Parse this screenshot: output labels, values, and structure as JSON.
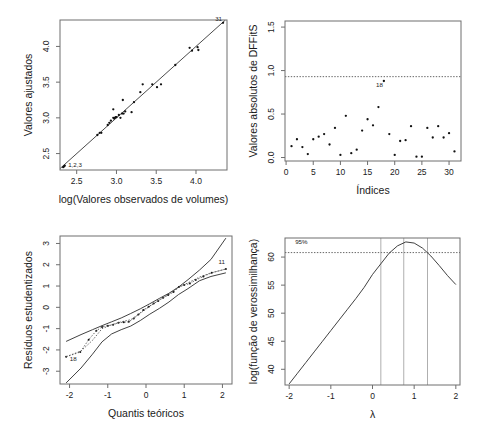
{
  "figure": {
    "title": "",
    "panels": [
      {
        "id": "fitted-vs-observed",
        "position": "top-left",
        "type": "scatter",
        "xlabel": "log(Valores observados de volumes)",
        "ylabel": "Valores ajustados",
        "xticks": [
          2.5,
          3.0,
          3.5,
          4.0
        ],
        "xticklabels": [
          "2.5",
          "3.0",
          "3.5",
          "4.0"
        ],
        "yticks": [
          2.5,
          3.0,
          3.5,
          4.0
        ],
        "yticklabels": [
          "2.5",
          "3.0",
          "3.5",
          "4.0"
        ],
        "xlim": [
          2.29,
          4.39
        ],
        "ylim": [
          2.27,
          4.37
        ],
        "grid": false,
        "reference_line": {
          "type": "identity",
          "style": "solid"
        },
        "annotations": [
          {
            "text": "31",
            "x": 4.34,
            "y": 4.33
          },
          {
            "text": "1,2,3",
            "x": 2.38,
            "y": 2.29
          }
        ],
        "points": [
          {
            "x": 2.33,
            "y": 2.31
          },
          {
            "x": 2.34,
            "y": 2.32
          },
          {
            "x": 2.35,
            "y": 2.33
          },
          {
            "x": 2.76,
            "y": 2.76
          },
          {
            "x": 2.79,
            "y": 2.79
          },
          {
            "x": 2.81,
            "y": 2.79
          },
          {
            "x": 2.89,
            "y": 2.9
          },
          {
            "x": 2.91,
            "y": 2.93
          },
          {
            "x": 2.93,
            "y": 2.96
          },
          {
            "x": 2.96,
            "y": 3.0
          },
          {
            "x": 2.97,
            "y": 2.99
          },
          {
            "x": 2.98,
            "y": 3.0
          },
          {
            "x": 2.99,
            "y": 3.01
          },
          {
            "x": 3.0,
            "y": 3.01
          },
          {
            "x": 2.96,
            "y": 3.12
          },
          {
            "x": 3.03,
            "y": 3.04
          },
          {
            "x": 3.05,
            "y": 3.0
          },
          {
            "x": 3.07,
            "y": 3.06
          },
          {
            "x": 3.09,
            "y": 3.06
          },
          {
            "x": 3.11,
            "y": 3.09
          },
          {
            "x": 3.08,
            "y": 3.25
          },
          {
            "x": 3.19,
            "y": 3.08
          },
          {
            "x": 3.22,
            "y": 3.22
          },
          {
            "x": 3.3,
            "y": 3.36
          },
          {
            "x": 3.33,
            "y": 3.47
          },
          {
            "x": 3.45,
            "y": 3.47
          },
          {
            "x": 3.51,
            "y": 3.43
          },
          {
            "x": 3.56,
            "y": 3.47
          },
          {
            "x": 3.74,
            "y": 3.74
          },
          {
            "x": 3.92,
            "y": 3.98
          },
          {
            "x": 3.95,
            "y": 3.94
          },
          {
            "x": 4.02,
            "y": 3.99
          },
          {
            "x": 4.03,
            "y": 3.95
          },
          {
            "x": 4.34,
            "y": 4.33
          }
        ]
      },
      {
        "id": "dffits-absolute",
        "position": "top-right",
        "type": "scatter",
        "xlabel": "Índices",
        "ylabel": "Valores absolutos de DFFitS",
        "xticks": [
          0,
          5,
          10,
          15,
          20,
          25,
          30
        ],
        "xticklabels": [
          "0",
          "5",
          "10",
          "15",
          "20",
          "25",
          "30"
        ],
        "yticks": [
          0.0,
          0.5,
          1.0,
          1.5
        ],
        "yticklabels": [
          "0.0",
          "0.5",
          "1.0",
          "1.5"
        ],
        "xlim": [
          -0.2,
          32.2
        ],
        "ylim": [
          -0.04,
          1.57
        ],
        "grid": false,
        "threshold_line": {
          "y": 0.93,
          "style": "dotted"
        },
        "annotations": [
          {
            "text": "18",
            "x": 18,
            "y": 0.79
          }
        ],
        "points": [
          {
            "x": 1,
            "y": 0.13
          },
          {
            "x": 2,
            "y": 0.21
          },
          {
            "x": 3,
            "y": 0.12
          },
          {
            "x": 4,
            "y": 0.04
          },
          {
            "x": 5,
            "y": 0.21
          },
          {
            "x": 6,
            "y": 0.24
          },
          {
            "x": 7,
            "y": 0.27
          },
          {
            "x": 8,
            "y": 0.15
          },
          {
            "x": 9,
            "y": 0.34
          },
          {
            "x": 10,
            "y": 0.03
          },
          {
            "x": 11,
            "y": 0.48
          },
          {
            "x": 12,
            "y": 0.05
          },
          {
            "x": 13,
            "y": 0.09
          },
          {
            "x": 14,
            "y": 0.31
          },
          {
            "x": 15,
            "y": 0.44
          },
          {
            "x": 16,
            "y": 0.37
          },
          {
            "x": 17,
            "y": 0.58
          },
          {
            "x": 18,
            "y": 0.88
          },
          {
            "x": 19,
            "y": 0.27
          },
          {
            "x": 20,
            "y": 0.03
          },
          {
            "x": 21,
            "y": 0.19
          },
          {
            "x": 22,
            "y": 0.2
          },
          {
            "x": 23,
            "y": 0.36
          },
          {
            "x": 24,
            "y": 0.01
          },
          {
            "x": 25,
            "y": 0.01
          },
          {
            "x": 26,
            "y": 0.34
          },
          {
            "x": 27,
            "y": 0.23
          },
          {
            "x": 28,
            "y": 0.36
          },
          {
            "x": 29,
            "y": 0.23
          },
          {
            "x": 30,
            "y": 0.28
          },
          {
            "x": 31,
            "y": 0.07
          }
        ]
      },
      {
        "id": "qq-envelope",
        "position": "bottom-left",
        "type": "line",
        "xlabel": "Quantis teóricos",
        "ylabel": "Resíduos estudentizados",
        "xticks": [
          -2,
          -1,
          0,
          1,
          2
        ],
        "xticklabels": [
          "-2",
          "-1",
          "0",
          "1",
          "2"
        ],
        "yticks": [
          -3,
          -2,
          -1,
          0,
          1,
          2,
          3
        ],
        "yticklabels": [
          "-3",
          "-2",
          "-1",
          "0",
          "1",
          "2",
          "3"
        ],
        "xlim": [
          -2.25,
          2.25
        ],
        "ylim": [
          -3.6,
          3.35
        ],
        "grid": false,
        "annotations": [
          {
            "text": "11",
            "x": 2.09,
            "y": 1.95
          },
          {
            "text": "18",
            "x": -2.02,
            "y": -2.62
          }
        ],
        "series": [
          {
            "name": "upper-envelope",
            "style": "solid",
            "x": [
              -2.09,
              -1.7,
              -1.4,
              -1.15,
              -0.9,
              -0.65,
              -0.4,
              -0.15,
              0.1,
              0.35,
              0.6,
              0.85,
              1.1,
              1.4,
              1.7,
              2.09
            ],
            "y": [
              -1.6,
              -1.28,
              -1.05,
              -0.86,
              -0.68,
              -0.5,
              -0.29,
              -0.07,
              0.17,
              0.42,
              0.66,
              0.95,
              1.3,
              1.75,
              2.25,
              3.25
            ]
          },
          {
            "name": "median-envelope",
            "style": "dotted",
            "x": [
              -2.09,
              -1.7,
              -1.4,
              -1.15,
              -0.9,
              -0.65,
              -0.4,
              -0.15,
              0.1,
              0.35,
              0.6,
              0.85,
              1.1,
              1.4,
              1.7,
              2.09
            ],
            "y": [
              -2.32,
              -2.05,
              -1.55,
              -1.0,
              -0.82,
              -0.68,
              -0.58,
              -0.28,
              0.05,
              0.35,
              0.62,
              0.95,
              1.15,
              1.42,
              1.62,
              1.8
            ]
          },
          {
            "name": "lower-envelope",
            "style": "solid",
            "x": [
              -2.09,
              -1.7,
              -1.4,
              -1.15,
              -0.9,
              -0.65,
              -0.4,
              -0.15,
              0.1,
              0.35,
              0.6,
              0.85,
              1.1,
              1.4,
              1.7,
              2.09
            ],
            "y": [
              -3.55,
              -2.85,
              -2.2,
              -1.62,
              -1.25,
              -1.05,
              -0.88,
              -0.62,
              -0.32,
              -0.05,
              0.25,
              0.6,
              0.88,
              1.25,
              1.45,
              1.62
            ]
          },
          {
            "name": "observed-residuals",
            "style": "points",
            "x": [
              -2.09,
              -1.72,
              -1.5,
              -1.3,
              -1.15,
              -1.0,
              -0.86,
              -0.72,
              -0.58,
              -0.45,
              -0.32,
              -0.2,
              -0.07,
              0.07,
              0.2,
              0.32,
              0.45,
              0.58,
              0.72,
              0.86,
              1.0,
              1.15,
              1.3,
              1.5,
              1.72,
              2.09
            ],
            "y": [
              -2.32,
              -2.1,
              -1.52,
              -1.1,
              -0.92,
              -0.86,
              -0.82,
              -0.72,
              -0.7,
              -0.68,
              -0.52,
              -0.34,
              -0.12,
              0.03,
              0.18,
              0.3,
              0.45,
              0.58,
              0.72,
              0.95,
              1.05,
              1.12,
              1.28,
              1.45,
              1.62,
              1.8
            ]
          }
        ]
      },
      {
        "id": "boxcox-loglik",
        "position": "bottom-right",
        "type": "line",
        "xlabel": "λ",
        "ylabel": "log(função de verossimilhança)",
        "xticks": [
          -2,
          -1,
          0,
          1,
          2
        ],
        "xticklabels": [
          "-2",
          "-1",
          "0",
          "1",
          "2"
        ],
        "yticks": [
          40,
          45,
          50,
          55,
          60
        ],
        "yticklabels": [
          "40",
          "45",
          "50",
          "55",
          "60"
        ],
        "xlim": [
          -2.1,
          2.1
        ],
        "ylim": [
          37.2,
          63.4
        ],
        "grid": false,
        "annotations": [
          {
            "text": "95%",
            "x": -1.88,
            "y": 61.9
          }
        ],
        "ci_line": {
          "y": 60.8,
          "label": "95%",
          "style": "dotted"
        },
        "vlines": [
          0.2,
          0.75,
          1.32
        ],
        "curve": {
          "x": [
            -2.0,
            -1.8,
            -1.6,
            -1.4,
            -1.2,
            -1.0,
            -0.8,
            -0.6,
            -0.4,
            -0.2,
            0.0,
            0.2,
            0.4,
            0.6,
            0.8,
            1.0,
            1.2,
            1.4,
            1.6,
            1.8,
            2.0
          ],
          "y": [
            37.4,
            39.3,
            41.2,
            43.1,
            45.0,
            46.9,
            48.8,
            50.7,
            52.6,
            54.6,
            56.9,
            58.8,
            60.7,
            62.0,
            62.7,
            62.5,
            61.6,
            60.2,
            58.5,
            56.7,
            55.1
          ]
        }
      }
    ]
  }
}
